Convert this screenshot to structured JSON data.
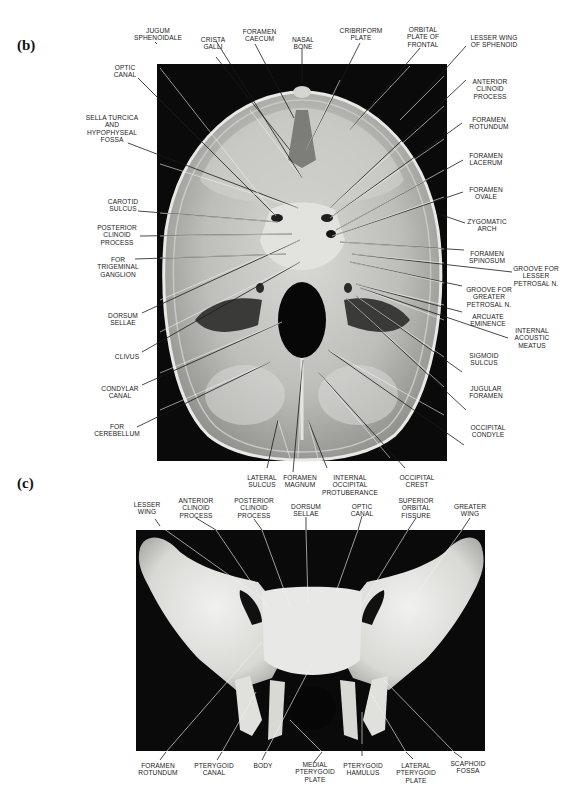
{
  "figure_b": {
    "panel_label": "(b)",
    "subject": "Base of skull, internal view (superior)",
    "labels": {
      "jugum_sphenoidale": "JUGUM\nSPHENOIDALE",
      "crista_galli": "CRISTA\nGALLI",
      "foramen_caecum": "FORAMEN\nCAECUM",
      "nasal_bone": "NASAL\nBONE",
      "cribriform_plate": "CRIBRIFORM\nPLATE",
      "orbital_plate_of_frontal": "ORBITAL\nPLATE OF\nFRONTAL",
      "lesser_wing_of_sphenoid": "LESSER WING\nOF SPHENOID",
      "optic_canal": "OPTIC\nCANAL",
      "sella_turcica": "SELLA TURCICA\nAND\nHYPOPHYSEAL\nFOSSA",
      "carotid_sulcus": "CAROTID\nSULCUS",
      "posterior_clinoid_process": "POSTERIOR\nCLINOID\nPROCESS",
      "for_trigeminal_ganglion": "FOR\nTRIGEMINAL\nGANGLION",
      "dorsum_sellae": "DORSUM\nSELLAE",
      "clivus": "CLIVUS",
      "condylar_canal": "CONDYLAR\nCANAL",
      "for_cerebellum": "FOR\nCEREBELLUM",
      "anterior_clinoid_process": "ANTERIOR\nCLINOID\nPROCESS",
      "foramen_rotundum": "FORAMEN\nROTUNDUM",
      "foramen_lacerum": "FORAMEN\nLACERUM",
      "foramen_ovale": "FORAMEN\nOVALE",
      "zygomatic_arch": "ZYGOMATIC\nARCH",
      "foramen_spinosum": "FORAMEN\nSPINOSUM",
      "groove_lesser_petrosal": "GROOVE FOR\nLESSER\nPETROSAL N.",
      "groove_greater_petrosal": "GROOVE FOR\nGREATER\nPETROSAL N.",
      "arcuate_eminence": "ARCUATE\nEMINENCE",
      "internal_acoustic_meatus": "INTERNAL\nACOUSTIC\nMEATUS",
      "sigmoid_sulcus": "SIGMOID\nSULCUS",
      "jugular_foramen": "JUGULAR\nFORAMEN",
      "occipital_condyle": "OCCIPITAL\nCONDYLE",
      "lateral_sulcus": "LATERAL\nSULCUS",
      "foramen_magnum": "FORAMEN\nMAGNUM",
      "internal_occipital_protuberance": "INTERNAL\nOCCIPITAL\nPROTUBERANCE",
      "occipital_crest": "OCCIPITAL\nCREST"
    }
  },
  "figure_c": {
    "panel_label": "(c)",
    "subject": "Sphenoid bone, posterior view",
    "labels": {
      "lesser_wing": "LESSER\nWING",
      "anterior_clinoid_process": "ANTERIOR\nCLINOID\nPROCESS",
      "posterior_clinoid_process": "POSTERIOR\nCLINOID\nPROCESS",
      "dorsum_sellae": "DORSUM\nSELLAE",
      "optic_canal": "OPTIC\nCANAL",
      "superior_orbital_fissure": "SUPERIOR\nORBITAL\nFISSURE",
      "greater_wing": "GREATER\nWING",
      "foramen_rotundum": "FORAMEN\nROTUNDUM",
      "pterygoid_canal": "PTERYGOID\nCANAL",
      "body": "BODY",
      "medial_pterygoid_plate": "MEDIAL\nPTERYGOID\nPLATE",
      "pterygoid_hamulus": "PTERYGOID\nHAMULUS",
      "lateral_pterygoid_plate": "LATERAL\nPTERYGOID\nPLATE",
      "scaphoid_fossa": "SCAPHOID\nFOSSA"
    }
  },
  "colors": {
    "background": "#ffffff",
    "photo_background": "#0a0a0a",
    "bone_light": "#e6e6e4",
    "bone_mid": "#a9a9a6",
    "leader_line_on_white": "#1a1a1a",
    "leader_line_on_photo": "#f2f2f2",
    "text": "#1a1a1a"
  }
}
